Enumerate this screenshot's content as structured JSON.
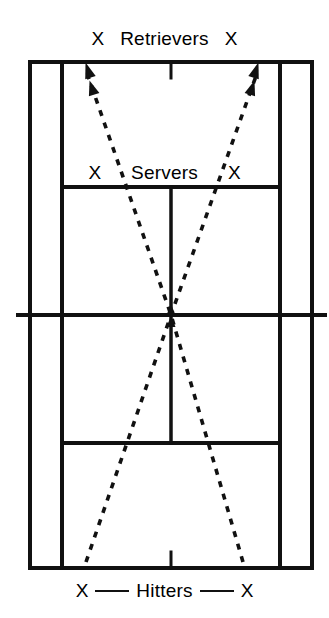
{
  "diagram": {
    "type": "tennis-court-diagram",
    "colors": {
      "line": "#111111",
      "path": "#111111",
      "background": "#ffffff"
    }
  },
  "labels": {
    "top": {
      "left_marker": "X",
      "text": "Retrievers",
      "right_marker": "X"
    },
    "service": {
      "left_marker": "X",
      "text": "Servers",
      "right_marker": "X"
    },
    "bottom": {
      "left_marker": "X",
      "text": "Hitters",
      "right_marker": "X"
    }
  },
  "court": {
    "doubles_sideline_left_x": 30,
    "doubles_sideline_right_x": 312,
    "singles_sideline_left_x": 62,
    "singles_sideline_right_x": 280,
    "baseline_top_y": 62,
    "baseline_bottom_y": 568,
    "service_line_top_y": 187,
    "service_line_bottom_y": 443,
    "net_y": 315,
    "net_extent_left_x": 18,
    "net_extent_right_x": 325,
    "center_x": 171
  },
  "paths": [
    {
      "name": "left-hitter-to-right-retriever",
      "style": "dashed",
      "from": {
        "x": 86,
        "y": 562
      },
      "to": {
        "x": 256,
        "y": 72
      },
      "arrowheads": "double-at-end-and-mid"
    },
    {
      "name": "right-hitter-to-left-retriever",
      "style": "dashed",
      "from": {
        "x": 243,
        "y": 562
      },
      "to": {
        "x": 88,
        "y": 72
      },
      "arrowheads": "double-at-end-and-mid"
    }
  ]
}
